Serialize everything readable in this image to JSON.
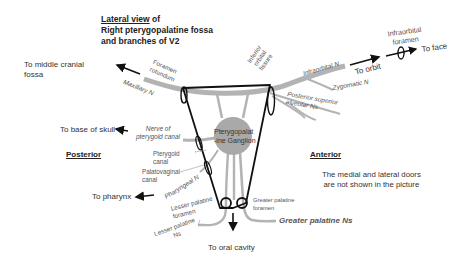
{
  "title": {
    "line1_underlined": "Lateral view",
    "line1_rest": " of",
    "line2": "Right pterygopalatine fossa",
    "line3": "and branches of V2"
  },
  "directions": {
    "middle_cranial_fossa": "To middle cranial fossa",
    "base_of_skull": "To base of skull",
    "pharynx": "To pharynx",
    "oral_cavity": "To oral cavity",
    "orbit": "To orbit",
    "face": "To face"
  },
  "orientation": {
    "posterior": "Posterior",
    "anterior": "Anterior"
  },
  "foramina": {
    "foramen_rotundum": "Foramen rotundum",
    "inferior_orbital_fissure": "Inferior orbital fissure",
    "infraorbital_foramen": "Infraorbital foramen",
    "pterygoid_canal": "Pterygoid canal",
    "palatovaginal_canal": "Palatovaginal canal",
    "lesser_palatine_foramen": "Lesser palatine foramen",
    "greater_palatine_foramen": "Greater palatine foramen"
  },
  "nerves": {
    "maxillary": "Maxillary N",
    "infraorbital": "Infraorbital N",
    "zygomatic": "Zygomatic N",
    "posterior_superior_alveolar": "Posterior superior alveolar Ns",
    "nerve_of_pterygoid_canal": "Nerve of pterygoid canal",
    "pharyngeal": "Pharyngeal N",
    "lesser_palatine": "Lesser palatine Ns",
    "greater_palatine": "Greater palatine Ns"
  },
  "ganglion": {
    "line1": "Pterygopalat",
    "line2": "-ine Ganglion"
  },
  "note": {
    "line1": "The medial and lateral doors",
    "line2": "are not shown in the picture"
  },
  "colors": {
    "nerve_gray": "#b3b3b3",
    "ganglion_gray": "#a9a9a9",
    "outline_black": "#111111"
  }
}
